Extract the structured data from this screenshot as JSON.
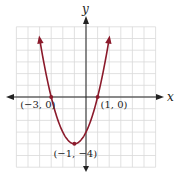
{
  "chart_data": {
    "type": "line",
    "title": "",
    "function": "y = x^2 + 2x - 3",
    "xlabel": "x",
    "ylabel": "y",
    "xlim": [
      -6,
      6
    ],
    "ylim": [
      -6,
      6
    ],
    "grid": true,
    "grid_step": 1,
    "series": [
      {
        "name": "parabola",
        "color": "#8b1a2b",
        "x": [
          -4.1,
          -4,
          -3,
          -2,
          -1,
          0,
          1,
          2,
          2.1
        ],
        "y": [
          5.61,
          5,
          0,
          -3,
          -4,
          -3,
          0,
          5,
          5.61
        ]
      }
    ],
    "points": [
      {
        "x": -3,
        "y": 0,
        "label": "(−3, 0)"
      },
      {
        "x": 1,
        "y": 0,
        "label": "(1, 0)"
      },
      {
        "x": -1,
        "y": -4,
        "label": "(−1, −4)"
      }
    ]
  },
  "colors": {
    "curve": "#8b1a2b",
    "axis": "#222222",
    "grid": "#d9d9d9"
  }
}
